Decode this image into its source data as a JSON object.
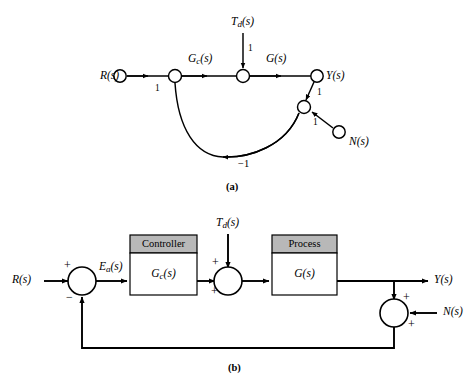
{
  "figure": {
    "captions": {
      "a": "(a)",
      "b": "(b)"
    },
    "colors": {
      "line": "#000000",
      "block_header_fill": "#b8b8b8",
      "block_body_fill": "#ffffff",
      "background": "#ffffff"
    }
  },
  "signal_flow_graph": {
    "nodes": [
      {
        "id": "R",
        "label_base": "R",
        "label_sub": "",
        "label_tail": "(s)",
        "label": "R(s)"
      },
      {
        "id": "sum1",
        "label": ""
      },
      {
        "id": "mid",
        "label": ""
      },
      {
        "id": "Y",
        "label_base": "Y",
        "label_sub": "",
        "label_tail": "(s)",
        "label": "Y(s)"
      },
      {
        "id": "junction",
        "label": ""
      },
      {
        "id": "N",
        "label_base": "N",
        "label_sub": "",
        "label_tail": "(s)",
        "label": "N(s)"
      }
    ],
    "input_labels": {
      "R": "R(s)",
      "Td": "T",
      "Td_sub": "d",
      "Td_tail": "(s)",
      "Y": "Y(s)",
      "N": "N(s)"
    },
    "branch_labels": {
      "Gc": "G",
      "Gc_sub": "c",
      "Gc_tail": "(s)",
      "G": "G(s)",
      "gain_R_to_sum": "1",
      "gain_Td": "1",
      "gain_Y_to_junction": "1",
      "gain_N_to_junction": "1",
      "gain_feedback": "−1"
    }
  },
  "block_diagram": {
    "signals": {
      "input": "R(s)",
      "error_base": "E",
      "error_sub": "a",
      "error_tail": "(s)",
      "error": "Ea(s)",
      "disturbance_base": "T",
      "disturbance_sub": "d",
      "disturbance_tail": "(s)",
      "disturbance": "Td(s)",
      "output": "Y(s)",
      "noise": "N(s)"
    },
    "blocks": [
      {
        "id": "controller",
        "title": "Controller",
        "transfer_base": "G",
        "transfer_sub": "c",
        "transfer_tail": "(s)",
        "transfer": "Gc(s)"
      },
      {
        "id": "process",
        "title": "Process",
        "transfer_base": "G",
        "transfer_sub": "",
        "transfer_tail": "(s)",
        "transfer": "G(s)"
      }
    ],
    "summing_junctions": [
      {
        "id": "sum-error",
        "signs": {
          "top": "+",
          "bottom": "−"
        }
      },
      {
        "id": "sum-disturbance",
        "signs": {
          "top": "+",
          "bottom": "+"
        }
      },
      {
        "id": "sum-noise",
        "signs": {
          "top": "+",
          "bottom": "+"
        }
      }
    ]
  }
}
